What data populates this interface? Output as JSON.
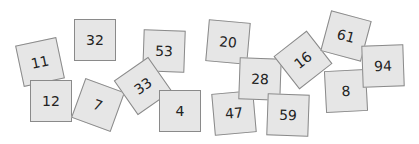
{
  "cards": [
    {
      "label": "11",
      "cx": 40,
      "cy": 62,
      "rot": -12
    },
    {
      "label": "12",
      "cx": 51,
      "cy": 101,
      "rot": 0
    },
    {
      "label": "32",
      "cx": 95,
      "cy": 40,
      "rot": 0
    },
    {
      "label": "7",
      "cx": 98,
      "cy": 105,
      "rot": 20
    },
    {
      "label": "53",
      "cx": 164,
      "cy": 51,
      "rot": 2
    },
    {
      "label": "33",
      "cx": 143,
      "cy": 86,
      "rot": -35
    },
    {
      "label": "4",
      "cx": 180,
      "cy": 111,
      "rot": 0
    },
    {
      "label": "20",
      "cx": 228,
      "cy": 42,
      "rot": 5
    },
    {
      "label": "47",
      "cx": 234,
      "cy": 113,
      "rot": -5
    },
    {
      "label": "28",
      "cx": 260,
      "cy": 79,
      "rot": 2
    },
    {
      "label": "59",
      "cx": 288,
      "cy": 115,
      "rot": 2
    },
    {
      "label": "16",
      "cx": 303,
      "cy": 60,
      "rot": -38
    },
    {
      "label": "61",
      "cx": 346,
      "cy": 36,
      "rot": 15
    },
    {
      "label": "8",
      "cx": 346,
      "cy": 91,
      "rot": -3
    },
    {
      "label": "94",
      "cx": 383,
      "cy": 66,
      "rot": -2
    }
  ],
  "colors": {
    "card_fill": "#e6e6e6",
    "card_border": "#8a8a8a",
    "text": "#222222"
  }
}
